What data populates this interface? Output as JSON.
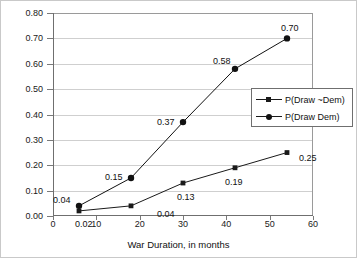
{
  "chart_data": {
    "type": "line",
    "title": "",
    "xlabel": "War Duration, in months",
    "ylabel": "",
    "xlim": [
      0,
      60
    ],
    "ylim": [
      0.0,
      0.8
    ],
    "xticks": [
      "0",
      "10",
      "20",
      "30",
      "40",
      "50",
      "60"
    ],
    "yticks": [
      "0.00",
      "0.10",
      "0.20",
      "0.30",
      "0.40",
      "0.50",
      "0.60",
      "0.70",
      "0.80"
    ],
    "grid": "horizontal",
    "legend_position": "right-middle",
    "x": [
      6,
      18,
      30,
      42,
      54
    ],
    "series": [
      {
        "name": "P(Draw ~Dem)",
        "marker": "square",
        "color": "#1a1a1a",
        "values": [
          0.02,
          0.04,
          0.13,
          0.19,
          0.25
        ],
        "labels": [
          "0.02",
          "0.04",
          "0.13",
          "0.19",
          "0.25"
        ]
      },
      {
        "name": "P(Draw Dem)",
        "marker": "circle",
        "color": "#111111",
        "values": [
          0.04,
          0.15,
          0.37,
          0.58,
          0.7
        ],
        "labels": [
          "0.04",
          "0.15",
          "0.37",
          "0.58",
          "0.70"
        ]
      }
    ]
  },
  "legend": {
    "entries": [
      {
        "label": "P(Draw ~Dem)"
      },
      {
        "label": "P(Draw Dem)"
      }
    ]
  },
  "axes": {
    "x_title": "War Duration, in months"
  }
}
